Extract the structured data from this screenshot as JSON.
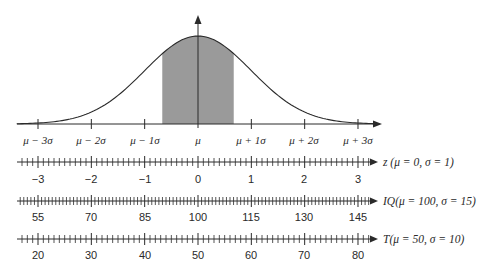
{
  "figure": {
    "colors": {
      "ink": "#2a2a2a",
      "shade": "#9a9a9a",
      "background": "#ffffff"
    },
    "curve": {
      "shaded_region_z": [
        -0.67,
        0.67
      ],
      "sigma_labels": [
        "μ − 3σ",
        "μ − 2σ",
        "μ − 1σ",
        "μ",
        "μ + 1σ",
        "μ + 2σ",
        "μ + 3σ"
      ]
    },
    "scales": [
      {
        "name": "z",
        "label": "z (μ = 0, σ = 1)",
        "mean": 0,
        "sd": 1,
        "major_step": 1,
        "minor_step": 0.1,
        "tick_labels": [
          "−3",
          "−2",
          "−1",
          "0",
          "1",
          "2",
          "3"
        ]
      },
      {
        "name": "IQ",
        "label": "IQ(μ = 100, σ = 15)",
        "mean": 100,
        "sd": 15,
        "major_step": 15,
        "minor_step": 1,
        "tick_labels": [
          "55",
          "70",
          "85",
          "100",
          "115",
          "130",
          "145"
        ]
      },
      {
        "name": "T",
        "label": "T(μ = 50, σ = 10)",
        "mean": 50,
        "sd": 10,
        "major_step": 10,
        "minor_step": 1,
        "tick_labels": [
          "20",
          "30",
          "40",
          "50",
          "60",
          "70",
          "80"
        ]
      }
    ]
  },
  "chart_data": {
    "type": "area",
    "title": "",
    "xlabel": "",
    "ylabel": "",
    "x_tick_labels": [
      "μ − 3σ",
      "μ − 2σ",
      "μ − 1σ",
      "μ",
      "μ + 1σ",
      "μ + 2σ",
      "μ + 3σ"
    ],
    "x": [
      -3,
      -2,
      -1,
      0,
      1,
      2,
      3
    ],
    "curve": "normal pdf",
    "shaded_range": [
      -0.67,
      0.67
    ],
    "xlim": [
      -3.4,
      3.4
    ],
    "grid": false,
    "scales": {
      "z": [
        -3,
        -2,
        -1,
        0,
        1,
        2,
        3
      ],
      "IQ": [
        55,
        70,
        85,
        100,
        115,
        130,
        145
      ],
      "T": [
        20,
        30,
        40,
        50,
        60,
        70,
        80
      ]
    }
  }
}
